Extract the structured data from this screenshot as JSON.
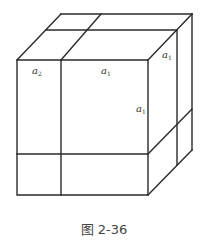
{
  "diagram": {
    "type": "cube-decomposition",
    "labels": [
      {
        "id": "front-top-left",
        "base": "a",
        "sub": "2"
      },
      {
        "id": "front-top-right",
        "base": "a",
        "sub": "1"
      },
      {
        "id": "top-depth",
        "base": "a",
        "sub": "1"
      },
      {
        "id": "front-height",
        "base": "a",
        "sub": "1"
      }
    ]
  },
  "caption": "图 2-36",
  "colors": {
    "stroke": "#2a2a2a",
    "background": "#ffffff"
  }
}
